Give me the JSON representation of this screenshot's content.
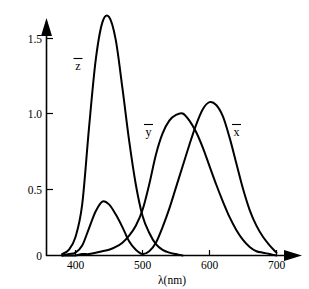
{
  "chart_data": {
    "type": "line",
    "title": "",
    "subtitle": "",
    "xlabel": "λ(nm)",
    "ylabel": "",
    "xlim": [
      360,
      710
    ],
    "ylim": [
      0,
      1.75
    ],
    "grid": false,
    "legend_position": "inline-curve-labels",
    "xticks": [
      400,
      500,
      600,
      700
    ],
    "xtick_labels": [
      "400",
      "500",
      "600",
      "700"
    ],
    "yticks": [
      0,
      0.5,
      1.0,
      1.5
    ],
    "ytick_labels": [
      "0",
      "0.5",
      "1.0",
      "1.5"
    ],
    "x": [
      380,
      390,
      400,
      410,
      420,
      430,
      440,
      450,
      460,
      470,
      480,
      490,
      500,
      510,
      520,
      530,
      540,
      550,
      560,
      570,
      580,
      590,
      600,
      610,
      620,
      630,
      640,
      650,
      660,
      670,
      680,
      690,
      700
    ],
    "series": [
      {
        "name": "x̄",
        "label": "x̄",
        "color": "#000000",
        "peak_x": 600,
        "peak_y": 1.08,
        "secondary_peak_x": 442,
        "secondary_peak_y": 0.38,
        "values": [
          0.0,
          0.01,
          0.02,
          0.07,
          0.19,
          0.31,
          0.38,
          0.36,
          0.29,
          0.2,
          0.1,
          0.04,
          0.01,
          0.03,
          0.09,
          0.2,
          0.33,
          0.48,
          0.63,
          0.78,
          0.92,
          1.03,
          1.08,
          1.06,
          0.98,
          0.83,
          0.65,
          0.47,
          0.32,
          0.21,
          0.13,
          0.07,
          0.02
        ]
      },
      {
        "name": "ȳ",
        "label": "ȳ",
        "color": "#000000",
        "peak_x": 555,
        "peak_y": 1.0,
        "values": [
          0.0,
          0.0,
          0.0,
          0.01,
          0.01,
          0.02,
          0.03,
          0.04,
          0.06,
          0.09,
          0.14,
          0.21,
          0.32,
          0.5,
          0.71,
          0.86,
          0.95,
          0.99,
          1.0,
          0.95,
          0.87,
          0.76,
          0.63,
          0.5,
          0.38,
          0.27,
          0.18,
          0.11,
          0.06,
          0.03,
          0.02,
          0.01,
          0.0
        ]
      },
      {
        "name": "z̄",
        "label": "z̄",
        "color": "#000000",
        "peak_x": 447,
        "peak_y": 1.68,
        "values": [
          0.01,
          0.04,
          0.13,
          0.36,
          0.89,
          1.37,
          1.64,
          1.68,
          1.52,
          1.18,
          0.81,
          0.5,
          0.28,
          0.16,
          0.08,
          0.04,
          0.02,
          0.01,
          0.0,
          0.0,
          0.0,
          0.0,
          0.0,
          0.0,
          0.0,
          0.0,
          0.0,
          0.0,
          0.0,
          0.0,
          0.0,
          0.0,
          0.0
        ]
      }
    ]
  },
  "axes": {
    "x_axis_label": "λ(nm)",
    "x_tick_labels": [
      "400",
      "500",
      "600",
      "700"
    ],
    "y_tick_labels": [
      "0",
      "0.5",
      "1.0",
      "1.5"
    ]
  },
  "curve_labels": {
    "z": "z̄",
    "y": "ȳ",
    "x": "x̄",
    "z_plain": "z",
    "y_plain": "y",
    "x_plain": "x"
  }
}
